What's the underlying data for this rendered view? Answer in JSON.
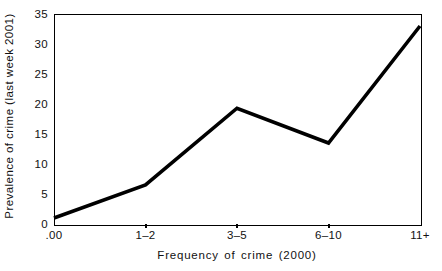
{
  "chart_data": {
    "type": "line",
    "title": "",
    "subtitle": "",
    "xlabel": "Frequency of crime (2000)",
    "ylabel": "Prevalence of crime (last week 2001)",
    "categories": [
      ".00",
      "1–2",
      "3–5",
      "6–10",
      "11+"
    ],
    "values": [
      1.0,
      6.5,
      19.3,
      13.5,
      33.0
    ],
    "yticks": [
      "0",
      "5",
      "10",
      "15",
      "20",
      "25",
      "30",
      "35"
    ],
    "ytick_values": [
      0,
      5,
      10,
      15,
      20,
      25,
      30,
      35
    ],
    "ylim": [
      0,
      35
    ],
    "grid": false,
    "legend": false,
    "legend_position": "none",
    "line_color": "#000000",
    "background_color": "#ffffff",
    "axis_color": "#000000"
  }
}
